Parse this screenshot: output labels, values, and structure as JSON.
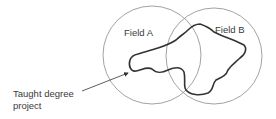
{
  "diagram": {
    "type": "venn",
    "sets": [
      {
        "id": "A",
        "label": "Field A"
      },
      {
        "id": "B",
        "label": "Field B"
      }
    ],
    "region_label": {
      "line1": "Taught degree",
      "line2": "project"
    },
    "colors": {
      "circle_stroke": "#8a8a8a",
      "region_stroke": "#333333",
      "text": "#3a3a3a",
      "background": "#ffffff"
    }
  }
}
